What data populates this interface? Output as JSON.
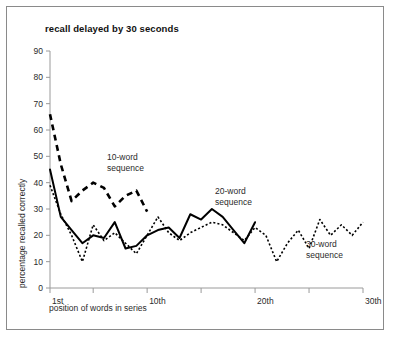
{
  "chart_data": {
    "type": "line",
    "title": "recall delayed by 30 seconds",
    "xlabel": "position of words in series",
    "ylabel": "percentage recalled correctly",
    "xlim": [
      1,
      30
    ],
    "ylim": [
      0,
      90
    ],
    "ytick_labels": [
      "0",
      "10",
      "20",
      "30",
      "40",
      "50",
      "60",
      "70",
      "80",
      "90"
    ],
    "ytick_values": [
      0,
      10,
      20,
      30,
      40,
      50,
      60,
      70,
      80,
      90
    ],
    "xtick_labels": [
      "1st",
      "10th",
      "20th",
      "30th"
    ],
    "xtick_values": [
      1,
      10,
      20,
      30
    ],
    "grid": false,
    "legend_position": "inline-annotations",
    "series": [
      {
        "name": "10-word sequence",
        "style": "dashed",
        "annotation": "10-word\nsequence",
        "annotation_line1": "10-word",
        "annotation_line2": "sequence",
        "x": [
          1,
          2,
          3,
          4,
          5,
          6,
          7,
          8,
          9,
          10
        ],
        "values": [
          66,
          47,
          33,
          37,
          40,
          38,
          31,
          35,
          37,
          29
        ]
      },
      {
        "name": "20-word sequence",
        "style": "solid",
        "annotation": "20-word\nsequence",
        "annotation_line1": "20-word",
        "annotation_line2": "sequence",
        "x": [
          1,
          2,
          3,
          4,
          5,
          6,
          7,
          8,
          9,
          10,
          11,
          12,
          13,
          14,
          15,
          16,
          17,
          18,
          19,
          20
        ],
        "values": [
          45,
          27,
          22,
          17,
          20,
          19,
          25,
          15,
          16,
          20,
          22,
          23,
          19,
          28,
          26,
          30,
          27,
          22,
          17,
          25
        ]
      },
      {
        "name": "30-word sequence",
        "style": "dotted",
        "annotation": "30-word\nsequence",
        "annotation_line1": "30-word",
        "annotation_line2": "sequence",
        "x": [
          1,
          2,
          3,
          4,
          5,
          6,
          7,
          8,
          9,
          10,
          11,
          12,
          13,
          14,
          15,
          16,
          17,
          18,
          19,
          20,
          21,
          22,
          23,
          24,
          25,
          26,
          27,
          28,
          29,
          30
        ],
        "values": [
          39,
          28,
          20,
          10,
          24,
          18,
          21,
          17,
          13,
          20,
          27,
          21,
          18,
          21,
          23,
          25,
          24,
          21,
          18,
          23,
          20,
          10,
          17,
          22,
          15,
          26,
          20,
          24,
          20,
          25
        ]
      }
    ]
  },
  "axis": {
    "y_title": "percentage recalled correctly",
    "x_title": "position of words in series"
  }
}
